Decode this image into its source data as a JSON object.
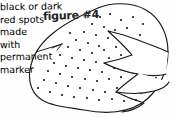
{
  "figure": {
    "title": "figure #4",
    "title_icon": "hash-icon",
    "number": 4
  },
  "annotation": {
    "name": "spots-annotation",
    "lines": [
      "black or dark",
      "red spots",
      "made",
      "with",
      "permanent",
      "marker"
    ],
    "full_text": "black or dark red spots made with permanent marker",
    "leader_line": "leader-line-to-blob"
  },
  "drawing": {
    "name": "hand-drawn-blob-figure",
    "description": "hand drawn rounded blob outline with three pointed wedge notches cut in from the right side, interior stippled with small dark spots",
    "ink_color": "#1a1a1a",
    "fill_color": "#ffffff",
    "background_color": "#fefefe",
    "stroke_width": 1.1,
    "blob_outline_path": "M 98 8 C 112 2 132 2 146 10 C 160 18 168 34 168 52 C 168 72 158 92 142 103 C 126 113 104 114 84 110 C 66 107 52 106 42 100 C 32 94 28 82 30 70 C 32 56 40 44 52 34 C 66 22 84 14 98 8 Z",
    "notch_upper_path": "M 168 52 C 160 48 148 44 138 40 C 128 36 118 33 108 31 C 118 40 126 48 132 55 C 124 58 114 61 104 63 C 114 68 126 72 138 74 C 150 76 160 76 166 74",
    "notch_mid_path": "M 104 63 C 114 68 126 72 138 74 C 130 80 122 86 116 92 C 128 94 142 94 154 91 C 162 89 167 86 169 82",
    "notch_lower_path": "M 116 92 C 124 96 134 100 144 103 C 138 108 130 111 122 112",
    "leader_path": "M 36 52 L 62 44 M 62 44 L 52 48 M 62 44 L 57 50",
    "spots": [
      {
        "x": 100,
        "y": 17
      },
      {
        "x": 110,
        "y": 14
      },
      {
        "x": 121,
        "y": 20
      },
      {
        "x": 133,
        "y": 17
      },
      {
        "x": 143,
        "y": 24
      },
      {
        "x": 92,
        "y": 24
      },
      {
        "x": 104,
        "y": 27
      },
      {
        "x": 115,
        "y": 30
      },
      {
        "x": 127,
        "y": 28
      },
      {
        "x": 84,
        "y": 32
      },
      {
        "x": 96,
        "y": 35
      },
      {
        "x": 108,
        "y": 38
      },
      {
        "x": 76,
        "y": 40
      },
      {
        "x": 88,
        "y": 43
      },
      {
        "x": 99,
        "y": 46
      },
      {
        "x": 68,
        "y": 47
      },
      {
        "x": 80,
        "y": 50
      },
      {
        "x": 92,
        "y": 53
      },
      {
        "x": 104,
        "y": 50
      },
      {
        "x": 116,
        "y": 47
      },
      {
        "x": 128,
        "y": 44
      },
      {
        "x": 60,
        "y": 55
      },
      {
        "x": 72,
        "y": 58
      },
      {
        "x": 84,
        "y": 60
      },
      {
        "x": 96,
        "y": 62
      },
      {
        "x": 109,
        "y": 58
      },
      {
        "x": 121,
        "y": 55
      },
      {
        "x": 54,
        "y": 63
      },
      {
        "x": 66,
        "y": 66
      },
      {
        "x": 78,
        "y": 68
      },
      {
        "x": 90,
        "y": 70
      },
      {
        "x": 102,
        "y": 72
      },
      {
        "x": 114,
        "y": 68
      },
      {
        "x": 48,
        "y": 71
      },
      {
        "x": 60,
        "y": 74
      },
      {
        "x": 72,
        "y": 77
      },
      {
        "x": 85,
        "y": 79
      },
      {
        "x": 97,
        "y": 81
      },
      {
        "x": 109,
        "y": 79
      },
      {
        "x": 121,
        "y": 77
      },
      {
        "x": 133,
        "y": 80
      },
      {
        "x": 145,
        "y": 84
      },
      {
        "x": 44,
        "y": 80
      },
      {
        "x": 56,
        "y": 83
      },
      {
        "x": 68,
        "y": 86
      },
      {
        "x": 80,
        "y": 88
      },
      {
        "x": 93,
        "y": 90
      },
      {
        "x": 105,
        "y": 92
      },
      {
        "x": 117,
        "y": 88
      },
      {
        "x": 129,
        "y": 90
      },
      {
        "x": 141,
        "y": 93
      },
      {
        "x": 50,
        "y": 92
      },
      {
        "x": 62,
        "y": 95
      },
      {
        "x": 74,
        "y": 97
      },
      {
        "x": 87,
        "y": 98
      },
      {
        "x": 99,
        "y": 100
      },
      {
        "x": 112,
        "y": 99
      },
      {
        "x": 124,
        "y": 101
      },
      {
        "x": 136,
        "y": 100
      },
      {
        "x": 70,
        "y": 33
      },
      {
        "x": 140,
        "y": 35
      },
      {
        "x": 152,
        "y": 62
      },
      {
        "x": 148,
        "y": 71
      },
      {
        "x": 156,
        "y": 78
      },
      {
        "x": 38,
        "y": 88
      },
      {
        "x": 132,
        "y": 63
      }
    ],
    "spot_radius": 1.1,
    "spot_count": 67
  }
}
